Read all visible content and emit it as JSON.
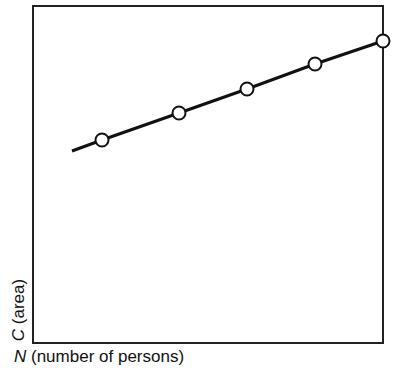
{
  "chart_data": {
    "type": "line",
    "title": "",
    "xlabel": "N (number of persons)",
    "ylabel": "C (area)",
    "xlabel_var": "N",
    "xlabel_rest": " (number of persons)",
    "ylabel_var": "C",
    "ylabel_rest": " (area)",
    "grid": false,
    "ticks": "none",
    "series": [
      {
        "name": "C vs N",
        "marker": "open-circle",
        "line_start_px": [
          72,
          151
        ],
        "points_px": [
          [
            102,
            140
          ],
          [
            179,
            113
          ],
          [
            247,
            89
          ],
          [
            315,
            64
          ],
          [
            383,
            41
          ]
        ]
      }
    ],
    "frame_px": {
      "x0": 33,
      "y0": 6,
      "x1": 383,
      "y1": 343
    },
    "colors": {
      "line": "#111111",
      "marker_fill": "#ffffff",
      "frame": "#222222"
    }
  }
}
